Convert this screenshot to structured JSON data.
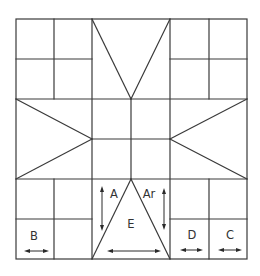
{
  "diagram": {
    "title": "",
    "colors": {
      "line": "#3a3a3a",
      "background": "#ffffff",
      "text": "#333333"
    },
    "labels": {
      "A": "A",
      "Ar": "Ar",
      "E": "E",
      "B": "B",
      "C": "C",
      "D": "D"
    }
  }
}
